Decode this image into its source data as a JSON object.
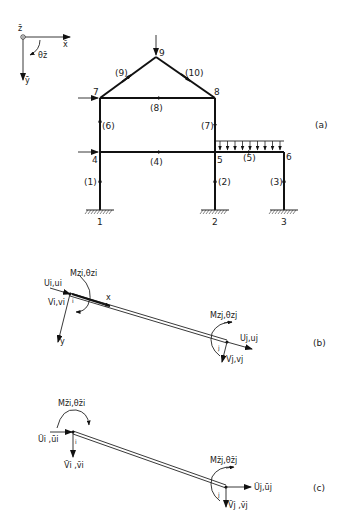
{
  "figure": {
    "coord_system": {
      "z_label": "z̄",
      "x_label": "x̄",
      "y_label": "ȳ",
      "theta_label": "θz̄"
    },
    "panel_a": {
      "label": "(a)",
      "nodes": [
        "1",
        "2",
        "3",
        "4",
        "5",
        "6",
        "7",
        "8",
        "9"
      ],
      "members": [
        "(1)",
        "(2)",
        "(3)",
        "(4)",
        "(5)",
        "(6)",
        "(7)",
        "(8)",
        "(9)",
        "(10)"
      ],
      "distributed_load": "uniform load on member (5)"
    },
    "panel_b": {
      "label": "(b)",
      "node_i": "i",
      "node_j": "j",
      "local_x": "x",
      "local_y": "y",
      "Ui": "Ui,ui",
      "Vi": "Vi,vi",
      "Mi": "Mzi,θzi",
      "Uj": "Uj,uj",
      "Vj": "Vj,vj",
      "Mj": "Mzj,θzj"
    },
    "panel_c": {
      "label": "(c)",
      "node_i": "i",
      "node_j": "j",
      "Ui": "Ūi ,ūi",
      "Vi": "V̄i ,v̄i",
      "Mi": "Mz̄i,θz̄i",
      "Uj": "Ūj,ūj",
      "Vj": "V̄j ,v̄j",
      "Mj": "Mz̄j,θz̄j"
    }
  }
}
